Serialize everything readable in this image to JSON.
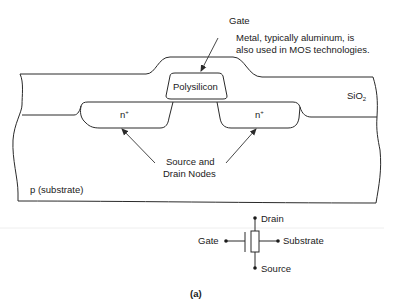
{
  "cross_section": {
    "gate_label": "Gate",
    "gate_note_line1": "Metal, typically aluminum, is",
    "gate_note_line2": "also used in MOS technologies.",
    "polysilicon_label": "Polysilicon",
    "oxide_label": "SiO",
    "oxide_subscript": "2",
    "source_region_label": "n",
    "drain_region_label": "n",
    "region_superscript": "+",
    "nodes_label_line1": "Source and",
    "nodes_label_line2": "Drain Nodes",
    "substrate_label": "p (substrate)"
  },
  "symbol": {
    "drain_label": "Drain",
    "gate_label": "Gate",
    "substrate_label": "Substrate",
    "source_label": "Source"
  },
  "caption": "(a)"
}
